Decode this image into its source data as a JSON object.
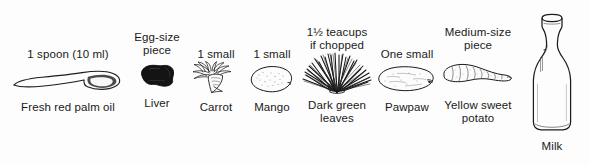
{
  "figure": {
    "background_color": "#fdfdfd",
    "text_color": "#1a1a1a"
  },
  "items": [
    {
      "id": "palm-oil",
      "quantity": "1 spoon (10 ml)",
      "name": "Fresh red palm oil",
      "icon": "spoon-icon"
    },
    {
      "id": "liver",
      "quantity": "Egg-size\npiece",
      "name": "Liver",
      "icon": "liver-icon"
    },
    {
      "id": "carrot",
      "quantity": "1 small",
      "name": "Carrot",
      "icon": "carrot-icon"
    },
    {
      "id": "mango",
      "quantity": "1 small",
      "name": "Mango",
      "icon": "mango-icon"
    },
    {
      "id": "leaves",
      "quantity": "1½ teacups\nif chopped",
      "name": "Dark green\nleaves",
      "icon": "dark-green-leaves-icon"
    },
    {
      "id": "pawpaw",
      "quantity": "One small",
      "name": "Pawpaw",
      "icon": "pawpaw-icon"
    },
    {
      "id": "potato",
      "quantity": "Medium-size\npiece",
      "name": "Yellow sweet\npotato",
      "icon": "sweet-potato-icon"
    },
    {
      "id": "milk",
      "quantity": "",
      "name": "Milk",
      "icon": "milk-bottle-icon"
    }
  ]
}
